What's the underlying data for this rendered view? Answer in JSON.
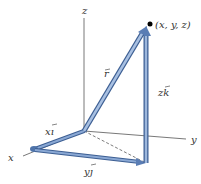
{
  "diagram": {
    "axes": {
      "x_label": "x",
      "y_label": "y",
      "z_label": "z"
    },
    "vectors": {
      "r": "r⃗",
      "xi": "xi⃗",
      "yj": "yj⃗",
      "zk": "zk⃗"
    },
    "vector_labels": {
      "r_text": "r",
      "xi_text": "xı",
      "yj_text": "yȷ",
      "zk_text": "zk"
    },
    "point_label": "(x, y, z)",
    "colors": {
      "vector_fill": "#6f93c6",
      "vector_stroke": "#3d5f93",
      "axis": "#333333",
      "point": "#000000"
    }
  }
}
